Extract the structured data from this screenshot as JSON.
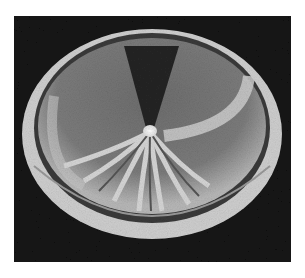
{
  "figure": {
    "colors": {
      "background": "#141414",
      "glow": "#d8d8d8",
      "mid": "#8a8a8a",
      "dark_wedge": "#2a2a2a",
      "core": "#ffffff"
    }
  }
}
